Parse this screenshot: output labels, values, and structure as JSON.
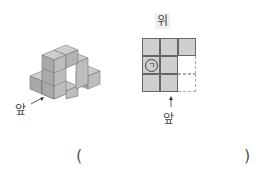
{
  "cube_figure": {
    "front_label": "앞",
    "cube_color": "#b8b8b8"
  },
  "top_view": {
    "top_label": "위",
    "front_label": "앞",
    "rows": 3,
    "cols": 3,
    "cells": [
      [
        1,
        1,
        1
      ],
      [
        1,
        1,
        0
      ],
      [
        1,
        1,
        0
      ]
    ],
    "marker_cell": {
      "row": 1,
      "col": 0,
      "text": "ㄱ"
    },
    "filled_color": "#cfcfcf"
  },
  "answer": {
    "open_paren": "(",
    "close_paren": ")"
  }
}
